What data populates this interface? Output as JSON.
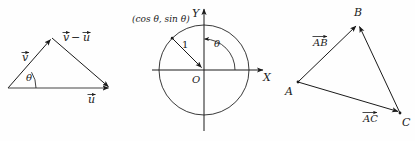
{
  "figure": {
    "background_color": "#fefefe",
    "ink_color": "#1a1a1a",
    "panels": [
      {
        "id": "vector-triangle",
        "caption": "Vector subtraction triangle",
        "labels": {
          "v": "v",
          "v_minus_u": "−",
          "u": "u",
          "theta": "θ"
        },
        "vertices": {
          "origin": [
            8,
            88
          ],
          "apex": [
            52,
            38
          ],
          "right": [
            110,
            88
          ]
        }
      },
      {
        "id": "unit-circle",
        "caption": "Unit circle with point (cos θ, sin θ)",
        "labels": {
          "point": "(cos θ, sin θ)",
          "radius": "1",
          "theta": "θ",
          "origin": "O",
          "x_axis": "X",
          "y_axis": "Y"
        },
        "center": [
          74,
          70
        ],
        "radius_px": 45,
        "angle_deg": 135
      },
      {
        "id": "abc-triangle",
        "caption": "Triangle ABC with vectors AB and AC",
        "labels": {
          "a": "A",
          "b": "B",
          "c": "C",
          "vec_ab": "AB",
          "vec_ac": "AC"
        },
        "vertices": {
          "A": [
            23,
            82
          ],
          "B": [
            83,
            24
          ],
          "C": [
            125,
            113
          ]
        }
      }
    ]
  }
}
